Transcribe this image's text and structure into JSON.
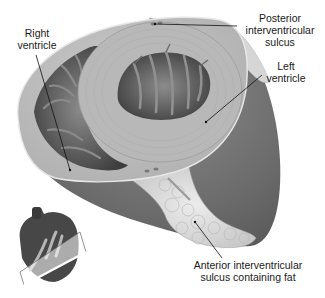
{
  "figure": {
    "colors": {
      "background": "#ffffff",
      "myocardium_cut": "#bdbdbd",
      "myocardium_ring": "#a9a9a9",
      "cavity": "#555555",
      "trabeculae": "#7a7a7a",
      "epicardium_outer": "#6e6e6e",
      "fat": "#d9d9d9",
      "inset_heart": "#4a4a4a",
      "inset_vessels": "#b8b8b8",
      "text": "#1a1a1a"
    }
  },
  "labels": {
    "right_ventricle": {
      "line1": "Right",
      "line2": "ventricle"
    },
    "posterior_sulcus": {
      "line1": "Posterior",
      "line2": "interventricular",
      "line3": "sulcus"
    },
    "left_ventricle": {
      "line1": "Left",
      "line2": "ventricle"
    },
    "anterior_sulcus": {
      "line1": "Anterior interventricular",
      "line2": "sulcus containing fat"
    }
  },
  "inset": {
    "description": "Orientation heart with oblique section plane"
  }
}
